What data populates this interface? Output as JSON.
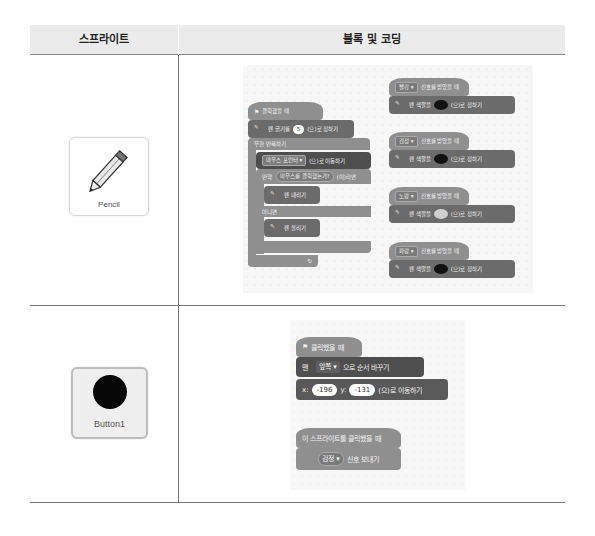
{
  "table": {
    "headers": {
      "sprite": "스프라이트",
      "blocks": "블록 및 코딩"
    }
  },
  "rows": [
    {
      "sprite": {
        "name": "Pencil",
        "icon": "pencil-icon"
      },
      "scripts": {
        "main": {
          "hat": "클릭했을 때",
          "set_size": {
            "text_before": "펜 굵기를",
            "value": "5",
            "text_after": "(으)로 정하기"
          },
          "forever": "무한 반복하기",
          "goto": {
            "dropdown": "마우스 포인터 ▾",
            "text_after": "(으)로 이동하기"
          },
          "if": {
            "label": "만약",
            "condition": "마우스를 클릭했는가?",
            "then": "(이)라면"
          },
          "pen_down": "펜 내리기",
          "else": "아니면",
          "pen_up": "펜 올리기",
          "loop_arrow": "↻"
        },
        "receivers": [
          {
            "signal": "빨강 ▾",
            "hat_text": "신호를 받았을 때",
            "set_color_before": "펜 색깔을",
            "set_color_after": "(으)로 정하기",
            "swatch": "dark"
          },
          {
            "signal": "검정 ▾",
            "hat_text": "신호를 받았을 때",
            "set_color_before": "펜 색깔을",
            "set_color_after": "(으)로 정하기",
            "swatch": "dark"
          },
          {
            "signal": "노랑 ▾",
            "hat_text": "신호를 받았을 때",
            "set_color_before": "펜 색깔을",
            "set_color_after": "(으)로 정하기",
            "swatch": "light"
          },
          {
            "signal": "파랑 ▾",
            "hat_text": "신호를 받았을 때",
            "set_color_before": "펜 색깔을",
            "set_color_after": "(으)로 정하기",
            "swatch": "dark"
          }
        ]
      }
    },
    {
      "sprite": {
        "name": "Button1",
        "icon": "black-circle-icon"
      },
      "scripts": {
        "main": {
          "hat": "클릭했을 때",
          "layer": {
            "label": "맨",
            "dropdown": "앞쪽 ▾",
            "text_after": "으로 순서 바꾸기"
          },
          "goto_xy": {
            "x_label": "x:",
            "x": "-196",
            "y_label": "y:",
            "y": "-131",
            "text_after": "(으)로 이동하기"
          }
        },
        "click": {
          "hat": "이 스프라이트를 클릭했을 때",
          "broadcast": {
            "dropdown": "검정 ▾",
            "text_after": "신호 보내기"
          }
        }
      }
    }
  ]
}
